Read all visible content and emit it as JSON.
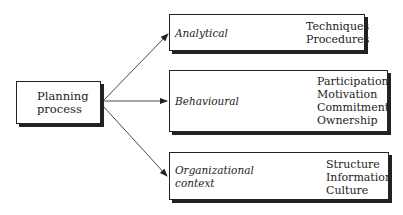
{
  "source": {
    "label_line1": "Planning",
    "label_line2": "process"
  },
  "targets": [
    {
      "label_line1": "Analytical",
      "label_line2": "",
      "items": [
        "Techniques",
        "Procedures"
      ]
    },
    {
      "label_line1": "Behavioural",
      "label_line2": "",
      "items": [
        "Participation",
        "Motivation",
        "Commitment",
        "Ownership"
      ]
    },
    {
      "label_line1": "Organizational",
      "label_line2": "context",
      "items": [
        "Structure",
        "Information",
        "Culture"
      ]
    }
  ]
}
